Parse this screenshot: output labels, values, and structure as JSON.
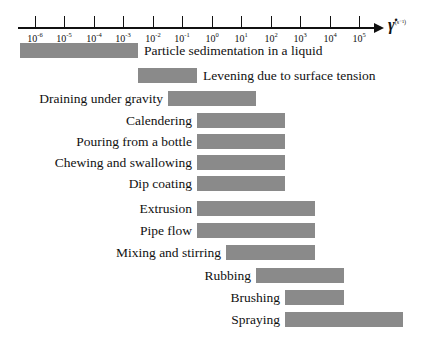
{
  "chart_data": {
    "type": "bar",
    "orientation": "horizontal-range",
    "title": "",
    "xlabel": "γ̇ (s⁻¹)",
    "x_scale": "log10",
    "xlim_exp": [
      -6.5,
      6.5
    ],
    "ticks": [
      "10^-6",
      "10^-5",
      "10^-4",
      "10^-3",
      "10^-2",
      "10^-1",
      "10^0",
      "10^1",
      "10^2",
      "10^3",
      "10^4",
      "10^5"
    ],
    "grid": false,
    "categories": [
      "Particle sedimentation in a liquid",
      "Levening due to surface tension",
      "Draining under gravity",
      "Calendering",
      "Pouring from a bottle",
      "Chewing and swallowing",
      "Dip coating",
      "Extrusion",
      "Pipe flow",
      "Mixing and stirring",
      "Rubbing",
      "Brushing",
      "Spraying"
    ],
    "ranges_log10": [
      [
        -6.5,
        -2.5
      ],
      [
        -2.5,
        -0.5
      ],
      [
        -1.5,
        1.5
      ],
      [
        -0.5,
        2.5
      ],
      [
        -0.5,
        2.5
      ],
      [
        -0.5,
        2.5
      ],
      [
        -0.5,
        2.5
      ],
      [
        -0.5,
        3.5
      ],
      [
        -0.5,
        3.5
      ],
      [
        0.5,
        3.5
      ],
      [
        1.5,
        4.5
      ],
      [
        2.5,
        4.5
      ],
      [
        2.5,
        6.5
      ]
    ],
    "label_side": [
      "right",
      "right",
      "left",
      "left",
      "left",
      "left",
      "left",
      "left",
      "left",
      "left",
      "left",
      "left",
      "left"
    ]
  },
  "axis": {
    "title_symbol": "γ̇",
    "title_unit": "(s⁻¹)",
    "tick_exponents": [
      "-6",
      "-5",
      "-4",
      "-3",
      "-2",
      "-1",
      "0",
      "1",
      "2",
      "3",
      "4",
      "5"
    ]
  },
  "colors": {
    "bar": "#8a8a8a",
    "axis": "#111111"
  }
}
